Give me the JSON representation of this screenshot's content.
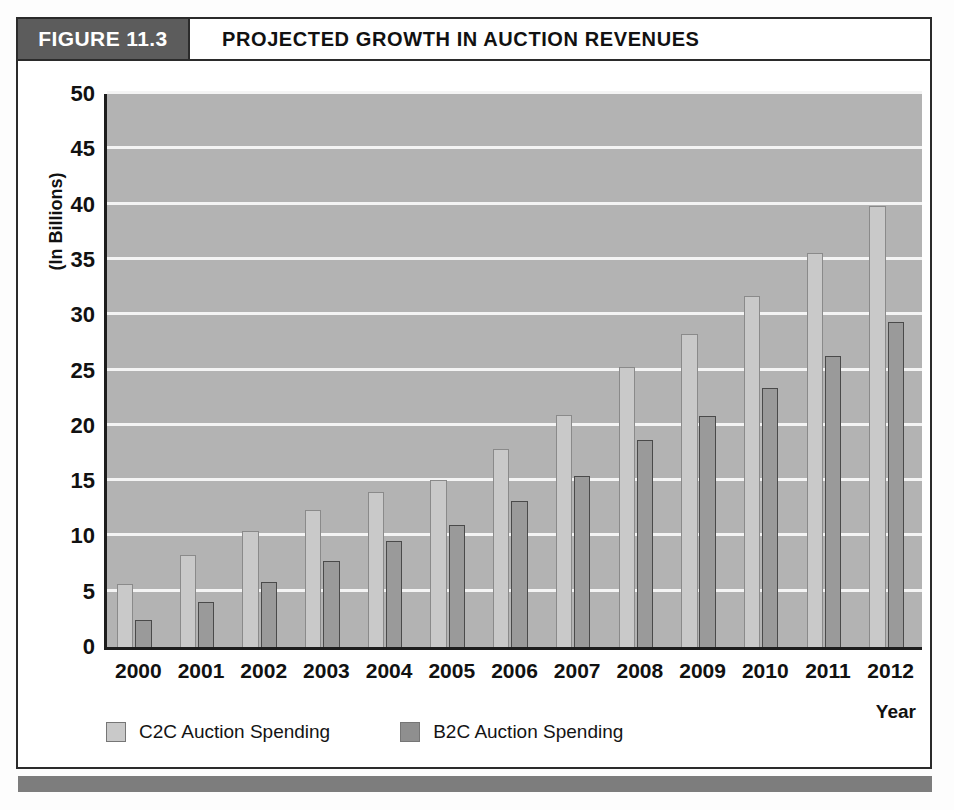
{
  "figure": {
    "tag": "FIGURE 11.3",
    "title": "PROJECTED GROWTH IN AUCTION REVENUES"
  },
  "axes": {
    "ylabel": "(In Billions)",
    "xlabel": "Year",
    "yticks": [
      "0",
      "5",
      "10",
      "15",
      "20",
      "25",
      "30",
      "35",
      "40",
      "45",
      "50"
    ]
  },
  "legend": {
    "items": [
      {
        "label": "C2C Auction Spending",
        "color": "#c9c9c9",
        "key": "c2c"
      },
      {
        "label": "B2C Auction Spending",
        "color": "#8f8f8f",
        "key": "b2c"
      }
    ]
  },
  "colors": {
    "plot_background": "#b3b3b3",
    "gridline": "#f4f4f4",
    "c2c_bar": "#c9c9c9",
    "b2c_bar": "#9a9a9a",
    "tag_background": "#5c5c5c",
    "frame": "#2b2b2b",
    "bottom_bar": "#7d7d7d"
  },
  "chart_data": {
    "type": "bar",
    "title": "PROJECTED GROWTH IN AUCTION REVENUES",
    "xlabel": "Year",
    "ylabel": "(In Billions)",
    "ylim": [
      0,
      50
    ],
    "ytick_step": 5,
    "grid": true,
    "legend_position": "bottom-left",
    "categories": [
      "2000",
      "2001",
      "2002",
      "2003",
      "2004",
      "2005",
      "2006",
      "2007",
      "2008",
      "2009",
      "2010",
      "2011",
      "2012"
    ],
    "series": [
      {
        "name": "C2C Auction Spending",
        "color": "#c9c9c9",
        "values": [
          5.7,
          8.3,
          10.5,
          12.4,
          14.0,
          15.1,
          17.9,
          21.0,
          25.3,
          28.3,
          31.7,
          35.6,
          39.9
        ]
      },
      {
        "name": "B2C Auction Spending",
        "color": "#9a9a9a",
        "values": [
          2.4,
          4.1,
          5.9,
          7.8,
          9.6,
          11.0,
          13.2,
          15.5,
          18.7,
          20.9,
          23.4,
          26.3,
          29.4
        ]
      }
    ]
  }
}
